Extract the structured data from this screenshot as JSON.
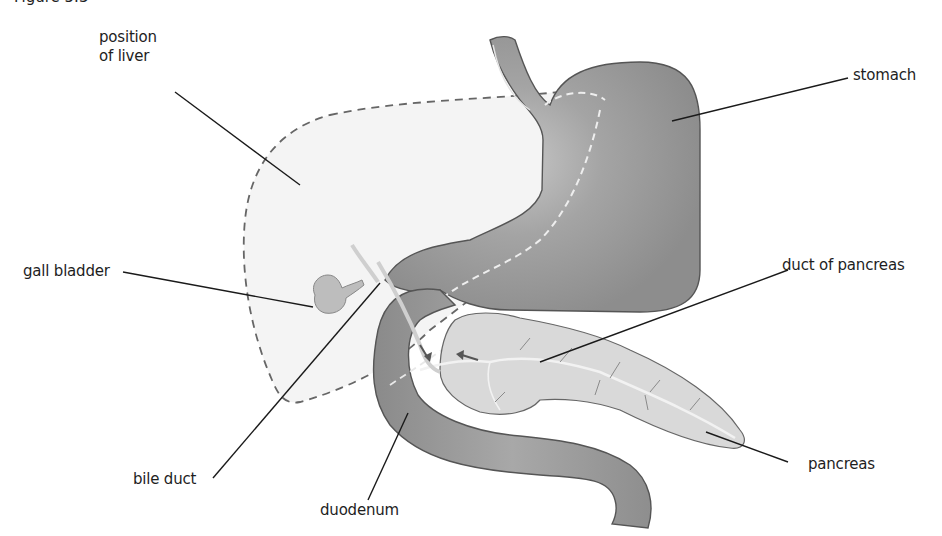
{
  "figure": {
    "top_caption": "Figure 5.3",
    "colors": {
      "background": "#ffffff",
      "organ_dark": "#8f8f8f",
      "organ_mid": "#a3a3a3",
      "organ_highlight": "#c9c9c9",
      "pancreas_fill": "#d9d9d9",
      "liver_fill": "#f4f4f4",
      "outline": "#555555",
      "leader_line": "#1a1a1a",
      "label_text": "#1e1e1e"
    }
  },
  "labels": {
    "liver_line1": "position",
    "liver_line2": "of liver",
    "stomach": "stomach",
    "gall_bladder": "gall bladder",
    "duct_of_pancreas": "duct of pancreas",
    "bile_duct": "bile duct",
    "duodenum": "duodenum",
    "pancreas": "pancreas"
  }
}
